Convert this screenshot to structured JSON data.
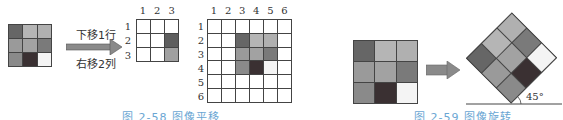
{
  "figure_258": {
    "caption": "图 2-58   图像平移",
    "source_grid": {
      "rows": 3,
      "cols": 3,
      "cells": [
        [
          "#666666",
          "#b5b5b5",
          "#b0b0b0"
        ],
        [
          "#9a9a9a",
          "#a2a2a2",
          "#7a7a7a"
        ],
        [
          "#8a8a8a",
          "#3a3032",
          "#f4f4f4"
        ]
      ]
    },
    "arrow": {
      "top_text": "下移1行",
      "bottom_text": "右移2列"
    },
    "partial_grid": {
      "col_labels": [
        "1",
        "2",
        "3"
      ],
      "row_labels": [
        "1",
        "2",
        "3"
      ],
      "cells": [
        [
          "#ffffff",
          "#ffffff",
          "#ffffff"
        ],
        [
          "#ffffff",
          "#ffffff",
          "#5e5e5e"
        ],
        [
          "#ffffff",
          "#ffffff",
          "#a0a0a0"
        ]
      ]
    },
    "result_grid": {
      "col_labels": [
        "1",
        "2",
        "3",
        "4",
        "5",
        "6"
      ],
      "row_labels": [
        "1",
        "2",
        "3",
        "4",
        "5",
        "6"
      ],
      "cells": [
        [
          "#ffffff",
          "#ffffff",
          "#ffffff",
          "#ffffff",
          "#ffffff",
          "#ffffff"
        ],
        [
          "#ffffff",
          "#ffffff",
          "#666666",
          "#b5b5b5",
          "#b0b0b0",
          "#ffffff"
        ],
        [
          "#ffffff",
          "#ffffff",
          "#9a9a9a",
          "#a2a2a2",
          "#7a7a7a",
          "#ffffff"
        ],
        [
          "#ffffff",
          "#ffffff",
          "#8a8a8a",
          "#3a3032",
          "#f4f4f4",
          "#ffffff"
        ],
        [
          "#ffffff",
          "#ffffff",
          "#ffffff",
          "#ffffff",
          "#ffffff",
          "#ffffff"
        ],
        [
          "#ffffff",
          "#ffffff",
          "#ffffff",
          "#ffffff",
          "#ffffff",
          "#ffffff"
        ]
      ]
    }
  },
  "figure_259": {
    "caption": "图 2-59   图像旋转",
    "source_grid": {
      "rows": 3,
      "cols": 3,
      "cells": [
        [
          "#666666",
          "#b5b5b5",
          "#b0b0b0"
        ],
        [
          "#9a9a9a",
          "#a2a2a2",
          "#7a7a7a"
        ],
        [
          "#8a8a8a",
          "#3a3032",
          "#f4f4f4"
        ]
      ]
    },
    "rotation_angle_label": "45°",
    "rotation_deg": -45
  },
  "colors": {
    "grid_line": "#444444",
    "arrow_fill": "#8a8a8a",
    "caption": "#6aa6d3"
  }
}
